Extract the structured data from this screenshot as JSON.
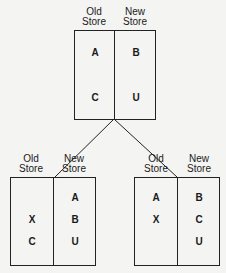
{
  "nodes": {
    "root": {
      "old_header": [
        "Old",
        "Store"
      ],
      "new_header": [
        "New",
        "Store"
      ],
      "old_items": [
        "A",
        "C"
      ],
      "new_items": [
        "B",
        "U"
      ]
    },
    "left_child": {
      "old_header": [
        "Old",
        "Store"
      ],
      "new_header": [
        "New",
        "Store"
      ],
      "old_items": [
        "X",
        "C"
      ],
      "new_items": [
        "A",
        "B",
        "U"
      ]
    },
    "right_child": {
      "old_header": [
        "Old",
        "Store"
      ],
      "new_header": [
        "New",
        "Store"
      ],
      "old_items": [
        "A",
        "X"
      ],
      "new_items": [
        "B",
        "C",
        "U"
      ]
    }
  },
  "colors": {
    "line": "#222222",
    "background": "#f4f4f2"
  }
}
